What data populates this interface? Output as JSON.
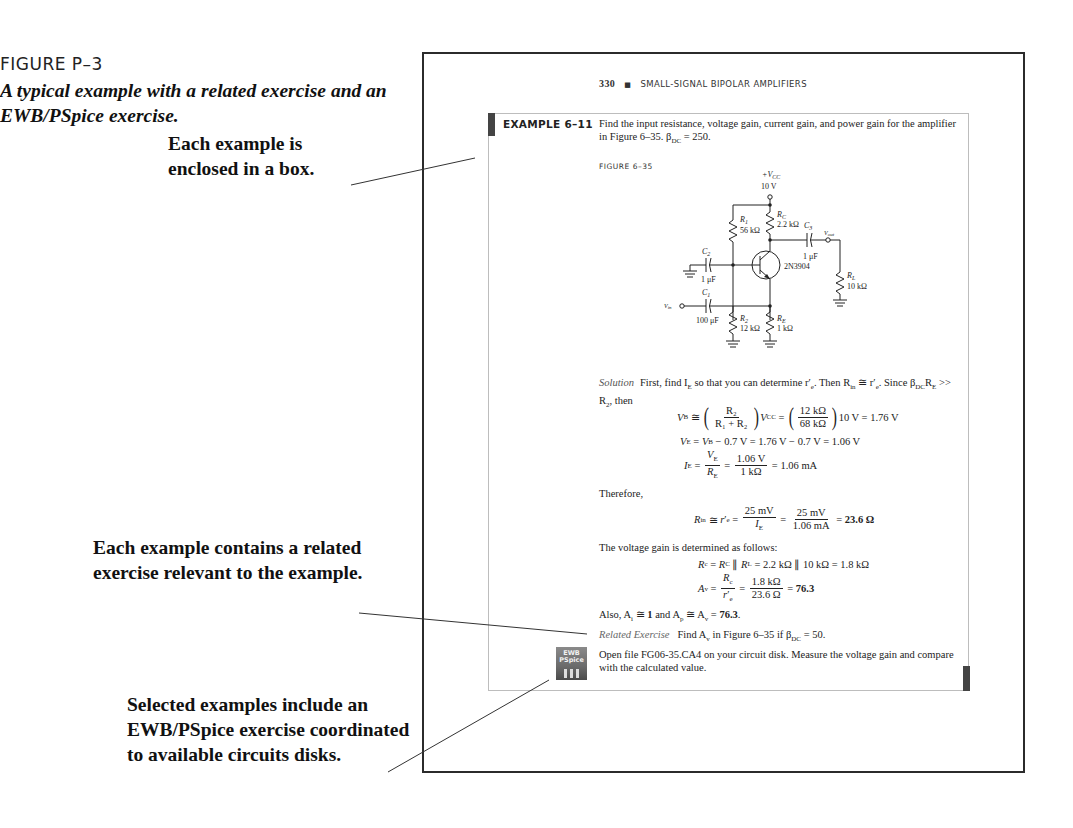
{
  "figure_caption": {
    "label": "FIGURE P–3",
    "text": "A typical example with a related exercise and an EWB/PSpice exercise."
  },
  "callouts": [
    {
      "text": "Each example is enclosed in a box."
    },
    {
      "text": "Each example contains a related exercise relevant to the example."
    },
    {
      "text": "Selected examples include an EWB/PSpice exercise coordinated to available circuits disks."
    }
  ],
  "page": {
    "running_head": {
      "page_number": "330",
      "separator": "■",
      "title": "SMALL-SIGNAL BIPOLAR AMPLIFIERS"
    },
    "example": {
      "label": "EXAMPLE 6–11",
      "problem": "Find the input resistance, voltage gain, current gain, and power gain for the amplifier in Figure 6–35. β",
      "problem_sub": "DC",
      "problem_tail": " = 250.",
      "figure_label": "FIGURE 6–35",
      "schematic": {
        "vcc_label": "+V",
        "vcc_sub": "CC",
        "vcc_value": "10 V",
        "components": [
          {
            "ref": "R1",
            "value": "56 kΩ"
          },
          {
            "ref": "RC",
            "value": "2.2 kΩ"
          },
          {
            "ref": "C3",
            "value": "1 μF"
          },
          {
            "ref": "C2",
            "value": "1 μF"
          },
          {
            "ref": "C1",
            "value": "100 μF"
          },
          {
            "ref": "R2",
            "value": "12 kΩ"
          },
          {
            "ref": "RE",
            "value": "1 kΩ"
          },
          {
            "ref": "RL",
            "value": "10 kΩ"
          },
          {
            "ref": "Q1",
            "value": "2N3904"
          }
        ],
        "vin_label": "V",
        "vin_sub": "in",
        "vout_label": "V",
        "vout_sub": "out"
      },
      "solution": {
        "lead": "Solution",
        "intro": "First, find I",
        "intro_2": " so that you can determine r′",
        "intro_3": ". Then R",
        "intro_4": " ≅ r′",
        "intro_5": ". Since β",
        "intro_6": "R",
        "intro_7": " >> R",
        "intro_8": ", then",
        "eq_vb": {
          "lhs": "V",
          "lhs_sub": "B",
          "num": "R₂",
          "den": "R₁ + R₂",
          "mid": "V",
          "mid_sub": "CC",
          "num2": "12 kΩ",
          "den2": "68 kΩ",
          "result": "10 V = 1.76 V"
        },
        "eq_ve": "V_E = V_B − 0.7 V = 1.76 V − 0.7 V = 1.06 V",
        "eq_ve_text": "− 0.7 V = 1.76 V − 0.7 V = 1.06 V",
        "eq_ie": {
          "num": "V",
          "den": "R",
          "num2": "1.06 V",
          "den2": "1 kΩ",
          "result": "= 1.06 mA"
        },
        "therefore": "Therefore,",
        "eq_rin": {
          "num": "25 mV",
          "den": "I",
          "num2": "25 mV",
          "den2": "1.06 mA",
          "result": "23.6 Ω"
        },
        "voltage_gain_text": "The voltage gain is determined as follows:",
        "eq_rc": "= 2.2 kΩ ∥ 10 kΩ = 1.8 kΩ",
        "eq_av": {
          "num2": "1.8 kΩ",
          "den2": "23.6 Ω",
          "result": "76.3"
        },
        "also_text": "Also, A",
        "also_1": " ≅ ",
        "also_val_1": "1",
        "also_2": " and A",
        "also_3": " ≅ A",
        "also_4": " = ",
        "also_val_2": "76.3",
        "also_end": "."
      },
      "related_exercise": {
        "lead": "Related Exercise",
        "text": "Find A",
        "text_2": " in Figure 6–35 if β",
        "text_3": " = 50."
      },
      "ewb_exercise": {
        "icon_line_1": "EWB",
        "icon_line_2": "PSpice",
        "text": "Open file FG06-35.CA4 on your circuit disk. Measure the voltage gain and compare with the calculated value."
      }
    }
  }
}
